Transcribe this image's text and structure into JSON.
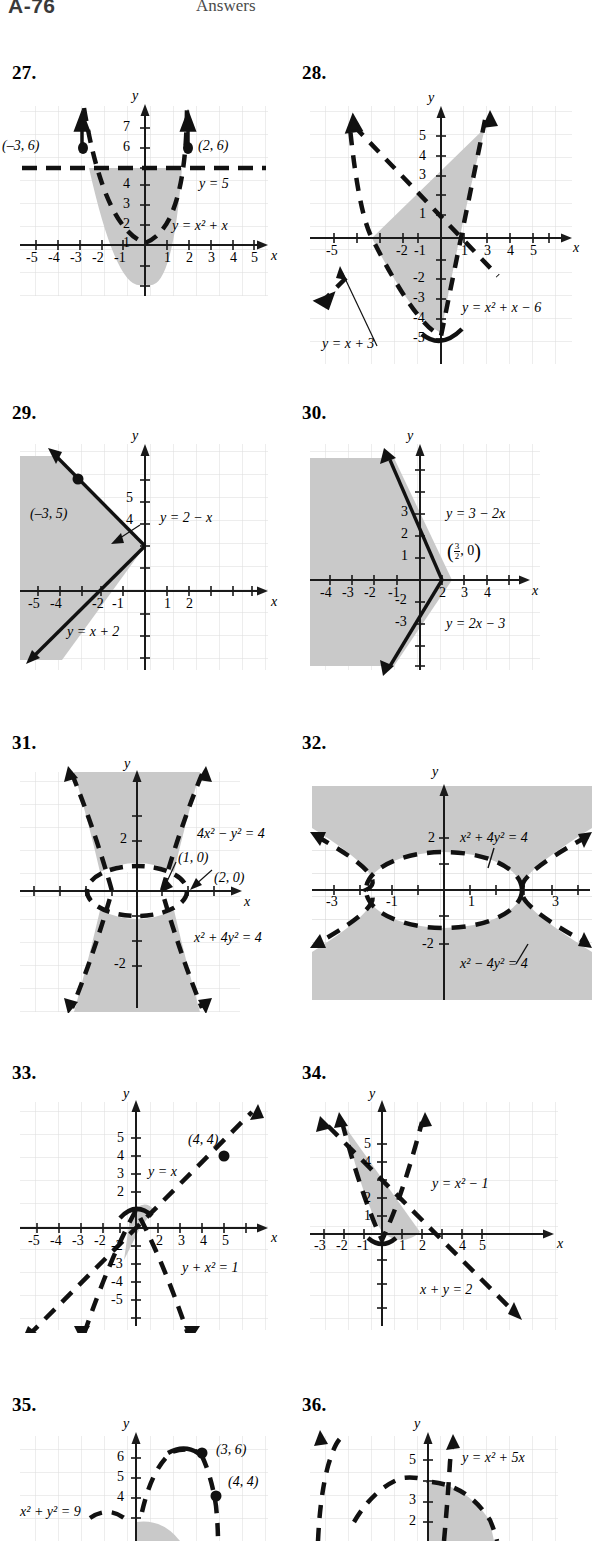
{
  "page": {
    "folio": "A-76",
    "running_head": "Answers",
    "width": 580,
    "height": 1541
  },
  "figures": [
    {
      "number": "27.",
      "axis": {
        "x_label": "x",
        "y_label": "y",
        "x_ticks": [
          "-5",
          "-4",
          "-3",
          "-2",
          "-1",
          "1",
          "2",
          "3",
          "4",
          "5"
        ],
        "y_ticks": [
          "1",
          "2",
          "3",
          "4",
          "7",
          "6"
        ]
      },
      "curve_labels": [
        "y = x² + x",
        "y = 5"
      ],
      "points": [
        "(–3, 6)",
        "(2, 6)"
      ],
      "system": [
        "y ≥ x² + x",
        "y ≤ 5"
      ],
      "shading": "region between parabola and horizontal line"
    },
    {
      "number": "28.",
      "axis": {
        "x_label": "x",
        "y_label": "y",
        "x_ticks": [
          "-5",
          "-2",
          "-1",
          "1",
          "3",
          "4",
          "5"
        ],
        "y_ticks": [
          "5",
          "4",
          "3",
          "1",
          "-2",
          "-3",
          "-4",
          "-5"
        ]
      },
      "curve_labels": [
        "y = x² + x − 6",
        "y = x + 3"
      ],
      "points": [],
      "shading": "region between line y = x + 3 and parabola"
    },
    {
      "number": "29.",
      "axis": {
        "x_label": "x",
        "y_label": "y",
        "x_ticks": [
          "-5",
          "-4",
          "-2",
          "-1",
          "1",
          "2"
        ],
        "y_ticks": [
          "5",
          "4"
        ]
      },
      "curve_labels": [
        "y = 2 − x",
        "y = x + 2"
      ],
      "points": [
        "(–3, 5)"
      ],
      "shading": "left wedge between the two lines"
    },
    {
      "number": "30.",
      "axis": {
        "x_label": "x",
        "y_label": "y",
        "x_ticks": [
          "-4",
          "-3",
          "-2",
          "-1",
          "2",
          "3",
          "4"
        ],
        "y_ticks": [
          "3",
          "2",
          "1",
          "-2",
          "-3"
        ]
      },
      "curve_labels": [
        "y = 3 − 2x",
        "y = 2x − 3"
      ],
      "points": [
        "(3/2, 0)"
      ],
      "point_fraction": {
        "numerator": "3",
        "denominator": "2",
        "second": "0"
      },
      "shading": "left wedge between the two lines"
    },
    {
      "number": "31.",
      "axis": {
        "x_label": "x",
        "y_label": "y",
        "x_ticks": [],
        "y_ticks": [
          "2",
          "-2"
        ]
      },
      "curve_labels": [
        "4x² − y² = 4",
        "x² + 4y² = 4"
      ],
      "points": [
        "(1, 0)",
        "(2, 0)"
      ],
      "shading": "inside hyperbola branches, outside ellipse"
    },
    {
      "number": "32.",
      "axis": {
        "x_label": "x",
        "y_label": "y",
        "x_ticks": [
          "-3",
          "-1",
          "1",
          "3"
        ],
        "y_ticks": [
          "2",
          "-2"
        ]
      },
      "curve_labels": [
        "x² + 4y² = 4",
        "x² − 4y² = 4"
      ],
      "points": [],
      "shading": "outside ellipse and outside hyperbola"
    },
    {
      "number": "33.",
      "axis": {
        "x_label": "x",
        "y_label": "y",
        "x_ticks": [
          "-5",
          "-4",
          "-3",
          "-2",
          "2",
          "3",
          "4",
          "5"
        ],
        "y_ticks": [
          "5",
          "4",
          "3",
          "2",
          "-2",
          "-3",
          "-4",
          "-5"
        ]
      },
      "curve_labels": [
        "y = x",
        "y + x² = 1"
      ],
      "points": [
        "(4, 4)"
      ],
      "shading": "small sliver between line and parabola"
    },
    {
      "number": "34.",
      "axis": {
        "x_label": "x",
        "y_label": "y",
        "x_ticks": [
          "-3",
          "-2",
          "-1",
          "1",
          "2",
          "4",
          "5"
        ],
        "y_ticks": [
          "5",
          "4",
          "2",
          "1"
        ]
      },
      "curve_labels": [
        "y = x² − 1",
        "x + y = 2"
      ],
      "points": [],
      "shading": "region between line and parabola"
    },
    {
      "number": "35.",
      "axis": {
        "x_label": "x",
        "y_label": "y",
        "x_ticks": [],
        "y_ticks": [
          "6",
          "5",
          "4"
        ]
      },
      "curve_labels": [
        "x² + y² = 9"
      ],
      "points": [
        "(3, 6)",
        "(4, 4)"
      ],
      "shading": "region near origin"
    },
    {
      "number": "36.",
      "axis": {
        "x_label": "x",
        "y_label": "y",
        "x_ticks": [],
        "y_ticks": [
          "5",
          "3",
          "2"
        ]
      },
      "curve_labels": [
        "y = x² + 5x"
      ],
      "points": [],
      "shading": "region under the parabola arc"
    }
  ],
  "style": {
    "shade_color": "#c9c9c9",
    "grid_color": "#d8d8d8",
    "axis_color": "#1a1a1a",
    "curve_color": "#111111"
  }
}
